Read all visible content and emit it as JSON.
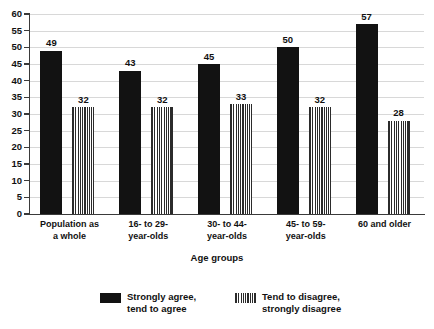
{
  "chart_data": {
    "type": "bar",
    "title": "",
    "subtitle": "",
    "xlabel": "Age groups",
    "ylabel": "",
    "ylim": [
      0,
      60
    ],
    "ytick_step": 5,
    "yticks": [
      0,
      5,
      10,
      15,
      20,
      25,
      30,
      35,
      40,
      45,
      50,
      55,
      60
    ],
    "grid": true,
    "grid_axis": "y",
    "legend_position": "bottom-center",
    "categories": [
      "Population as\na whole",
      "16- to 29-\nyear-olds",
      "30- to 44-\nyear-olds",
      "45- to 59-\nyear-olds",
      "60 and older"
    ],
    "series": [
      {
        "name": "Strongly agree,\ntend to agree",
        "values": [
          49,
          43,
          45,
          50,
          57
        ],
        "color": "#121212",
        "pattern": "solid"
      },
      {
        "name": "Tend to disagree,\nstrongly disagree",
        "values": [
          32,
          32,
          33,
          32,
          28
        ],
        "color": "#2b2b2b",
        "pattern": "vertical-stripes"
      }
    ]
  },
  "colors": {
    "background": "#ffffff",
    "axis": "#3a3a3a",
    "grid": "#d8d8d8",
    "text": "#111111",
    "series_solid": "#121212",
    "series_hatch": "#2b2b2b"
  },
  "legend": {
    "items": [
      {
        "label": "Strongly agree,\ntend to agree",
        "swatch": "solid"
      },
      {
        "label": "Tend to disagree,\nstrongly disagree",
        "swatch": "vertical-stripes"
      }
    ]
  },
  "axis": {
    "x_title": "Age groups"
  }
}
